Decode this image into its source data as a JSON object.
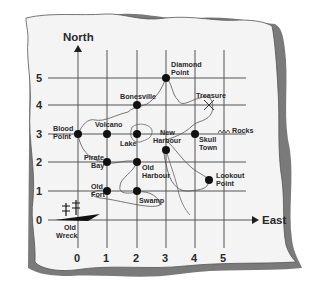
{
  "map": {
    "axes": {
      "north_label": "North",
      "east_label": "East",
      "x_ticks": [
        "0",
        "1",
        "2",
        "3",
        "4",
        "5"
      ],
      "y_ticks": [
        "0",
        "1",
        "2",
        "3",
        "4",
        "5"
      ]
    },
    "places": [
      {
        "name_line1": "Diamond",
        "name_line2": "Point",
        "x": 3,
        "y": 5
      },
      {
        "name_line1": "Bonesville",
        "name_line2": "",
        "x": 2,
        "y": 4
      },
      {
        "name_line1": "Treasure",
        "name_line2": "",
        "x": 4.5,
        "y": 4
      },
      {
        "name_line1": "Blood",
        "name_line2": "Point",
        "x": 0,
        "y": 3
      },
      {
        "name_line1": "Volcano",
        "name_line2": "",
        "x": 1,
        "y": 3
      },
      {
        "name_line1": "Lake",
        "name_line2": "",
        "x": 2,
        "y": 3
      },
      {
        "name_line1": "New",
        "name_line2": "Harbour",
        "x": 3,
        "y": 2.5
      },
      {
        "name_line1": "Skull",
        "name_line2": "Town",
        "x": 4,
        "y": 3
      },
      {
        "name_line1": "Rocks",
        "name_line2": "",
        "x": 4.5,
        "y": 3
      },
      {
        "name_line1": "Pirate",
        "name_line2": "Bay",
        "x": 1,
        "y": 2
      },
      {
        "name_line1": "Old",
        "name_line2": "Harbour",
        "x": 2,
        "y": 2
      },
      {
        "name_line1": "Lookout",
        "name_line2": "Point",
        "x": 4.5,
        "y": 1.5
      },
      {
        "name_line1": "Old",
        "name_line2": "Fort",
        "x": 1,
        "y": 1
      },
      {
        "name_line1": "Swamp",
        "name_line2": "",
        "x": 2,
        "y": 1
      },
      {
        "name_line1": "Old",
        "name_line2": "Wreck",
        "x": 0,
        "y": 0
      }
    ],
    "colors": {
      "paper": "#f4f4f4",
      "shadow": "#7a7a7a",
      "grid": "#555555",
      "ink": "#1e1e1e"
    }
  }
}
